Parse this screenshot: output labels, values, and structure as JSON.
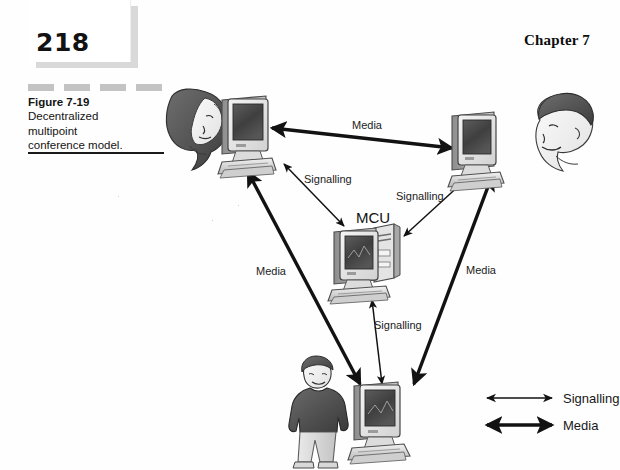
{
  "page": {
    "number": "218",
    "chapter_label": "Chapter 7"
  },
  "caption": {
    "figure_number": "Figure 7-19",
    "line1": "Decentralized",
    "line2": "multipoint",
    "line3": "conference model."
  },
  "diagram": {
    "center_node_label": "MCU",
    "edge_labels": {
      "media_top": "Media",
      "media_left": "Media",
      "media_right": "Media",
      "signalling_left": "Signalling",
      "signalling_right": "Signalling",
      "signalling_bottom": "Signalling"
    },
    "nodes": [
      {
        "id": "terminal-top-left",
        "type": "computer",
        "user": "woman-head"
      },
      {
        "id": "terminal-top-right",
        "type": "computer",
        "user": "man-head"
      },
      {
        "id": "terminal-bottom",
        "type": "computer",
        "user": "boy-standing"
      },
      {
        "id": "mcu",
        "type": "computer-with-tower",
        "user": null
      }
    ],
    "legend": {
      "signalling_label": "Signalling",
      "media_label": "Media"
    }
  },
  "colors": {
    "ink": "#121212",
    "paper": "#fefefe",
    "shadow_gray": "#d9d9d9",
    "dash_gray": "#c3c3c3",
    "screen_gray": "#4a4a4a"
  }
}
